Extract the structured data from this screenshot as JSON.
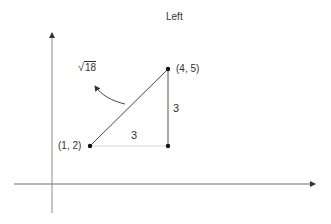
{
  "title": "Left",
  "axes": {
    "x_axis": {
      "from": [
        14,
        184
      ],
      "to": [
        316,
        184
      ]
    },
    "y_axis": {
      "from": [
        52,
        213
      ],
      "to": [
        52,
        32
      ]
    }
  },
  "points": [
    {
      "id": "p1",
      "label": "(1, 2)",
      "coords": [
        1,
        2
      ],
      "px": [
        90,
        146
      ]
    },
    {
      "id": "p2",
      "label": "(4, 5)",
      "coords": [
        4,
        5
      ],
      "px": [
        168,
        69
      ]
    },
    {
      "id": "corner",
      "label": "",
      "coords": [
        4,
        2
      ],
      "px": [
        168,
        146
      ]
    }
  ],
  "labels": {
    "horizontal_leg": "3",
    "vertical_leg": "3",
    "hypotenuse_radical": "√",
    "hypotenuse_value": "18"
  },
  "colors": {
    "axis": "#6f6f6f",
    "line": "#444444",
    "faint_line": "#d6d6d6",
    "point": "#111111",
    "text": "#333333"
  }
}
